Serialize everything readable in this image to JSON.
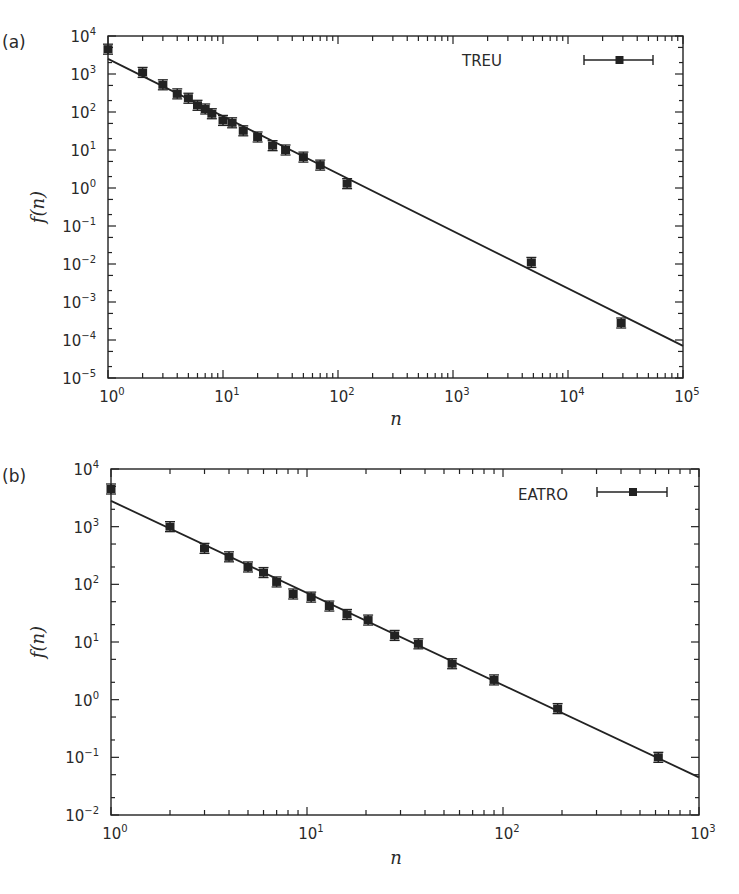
{
  "chart_data": [
    {
      "type": "scatter",
      "panel_label": "(a)",
      "title": "",
      "xlabel": "n",
      "ylabel": "f(n)",
      "xscale": "log",
      "yscale": "log",
      "xlim": [
        1,
        100000
      ],
      "ylim": [
        1e-05,
        10000
      ],
      "x_ticks": [
        "10^0",
        "10^1",
        "10^2",
        "10^3",
        "10^4",
        "10^5"
      ],
      "y_ticks": [
        "10^-5",
        "10^-4",
        "10^-3",
        "10^-2",
        "10^-1",
        "10^0",
        "10^1",
        "10^2",
        "10^3",
        "10^4"
      ],
      "grid": false,
      "legend": {
        "position": "top-right",
        "entries": [
          "TREU"
        ]
      },
      "series": [
        {
          "name": "TREU",
          "marker": "square-with-errorbars",
          "x": [
            1,
            2,
            3,
            4,
            5,
            6,
            7,
            8,
            10,
            12,
            15,
            20,
            27,
            35,
            50,
            70,
            120,
            4800,
            29000
          ],
          "y": [
            4500,
            1100,
            520,
            300,
            230,
            150,
            120,
            90,
            60,
            52,
            32,
            22,
            13,
            10,
            6.5,
            4,
            1.3,
            0.011,
            0.00028
          ]
        },
        {
          "name": "power-law fit",
          "type": "line",
          "x": [
            1,
            100000
          ],
          "y": [
            2500,
            7e-05
          ]
        }
      ]
    },
    {
      "type": "scatter",
      "panel_label": "(b)",
      "title": "",
      "xlabel": "n",
      "ylabel": "f(n)",
      "xscale": "log",
      "yscale": "log",
      "xlim": [
        1,
        1000
      ],
      "ylim": [
        0.01,
        10000
      ],
      "x_ticks": [
        "10^0",
        "10^1",
        "10^2",
        "10^3"
      ],
      "y_ticks": [
        "10^-2",
        "10^-1",
        "10^0",
        "10^1",
        "10^2",
        "10^3",
        "10^4"
      ],
      "grid": false,
      "legend": {
        "position": "top-right",
        "entries": [
          "EATRO"
        ]
      },
      "series": [
        {
          "name": "EATRO",
          "marker": "square-with-errorbars",
          "x": [
            1,
            2,
            3,
            4,
            5,
            6,
            7,
            8.5,
            10.5,
            13,
            16,
            20.5,
            28,
            37,
            55,
            90,
            190,
            620
          ],
          "y": [
            4500,
            1000,
            420,
            300,
            200,
            160,
            110,
            68,
            60,
            42,
            30,
            24,
            13,
            9.3,
            4.2,
            2.2,
            0.7,
            0.1
          ]
        },
        {
          "name": "power-law fit",
          "type": "line",
          "x": [
            1,
            1000
          ],
          "y": [
            2800,
            0.045
          ]
        }
      ]
    }
  ],
  "panels": {
    "a": {
      "label": "(a)",
      "legend": "TREU",
      "xlabel": "n",
      "ylabel": "f(n)"
    },
    "b": {
      "label": "(b)",
      "legend": "EATRO",
      "xlabel": "n",
      "ylabel": "f(n)"
    }
  },
  "colors": {
    "ink": "#222222",
    "background": "#ffffff"
  }
}
